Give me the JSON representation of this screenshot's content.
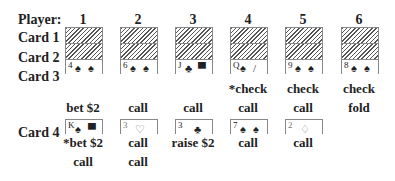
{
  "header": {
    "player_label": "Player:",
    "players": [
      "1",
      "2",
      "3",
      "4",
      "5",
      "6"
    ]
  },
  "rows": {
    "card1": "Card 1",
    "card2": "Card 2",
    "card3": "Card 3",
    "card4": "Card 4"
  },
  "card3": [
    {
      "rank": "4",
      "suit": "♠",
      "suit2": "♠",
      "color": "black"
    },
    {
      "rank": "6",
      "suit": "♠",
      "suit2": "♠",
      "color": "black"
    },
    {
      "rank": "J",
      "suit": "♣",
      "suit2": "▀",
      "color": "black"
    },
    {
      "rank": "Q",
      "suit": "♠",
      "suit2": "/",
      "color": "black"
    },
    {
      "rank": "9",
      "suit": "♠",
      "suit2": "♠",
      "color": "black"
    },
    {
      "rank": "8",
      "suit": "♠",
      "suit2": "♠",
      "color": "black"
    }
  ],
  "round3_actions": [
    [
      "bet $2",
      ""
    ],
    [
      "",
      "call"
    ],
    [
      "",
      "call"
    ],
    [
      "*check",
      "call"
    ],
    [
      "check",
      "call"
    ],
    [
      "check",
      "fold"
    ]
  ],
  "card4": [
    {
      "rank": "K",
      "suit": "♠",
      "suit2": "▀",
      "color": "black"
    },
    {
      "rank": "3",
      "suit": "♡",
      "suit2": "",
      "color": "red"
    },
    {
      "rank": "3",
      "suit": "♣",
      "suit2": "",
      "color": "black"
    },
    {
      "rank": "7",
      "suit": "♠",
      "suit2": "♠",
      "color": "black"
    },
    {
      "rank": "2",
      "suit": "♢",
      "suit2": "",
      "color": "red"
    }
  ],
  "round4_actions": [
    [
      "*bet $2",
      "call"
    ],
    [
      "call",
      "call"
    ],
    [
      "raise $2",
      ""
    ],
    [
      "call",
      ""
    ],
    [
      "call",
      ""
    ]
  ]
}
